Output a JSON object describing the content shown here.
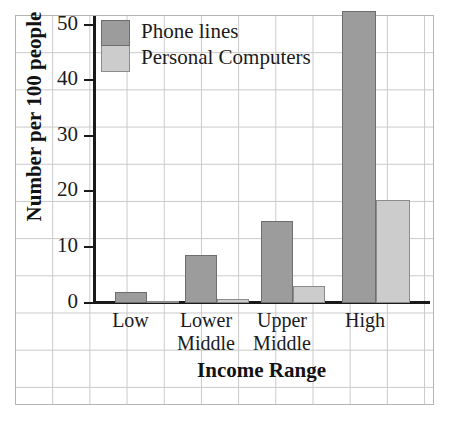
{
  "chart_data": {
    "type": "bar",
    "title": "",
    "xlabel": "Income Range",
    "ylabel": "Number per 100 people",
    "categories": [
      "Low",
      "Lower Middle",
      "Upper Middle",
      "High"
    ],
    "category_lines": [
      [
        "Low"
      ],
      [
        "Lower",
        "Middle"
      ],
      [
        "Upper",
        "Middle"
      ],
      [
        "High"
      ]
    ],
    "series": [
      {
        "name": "Phone lines",
        "color": "#9c9c9c",
        "values": [
          2,
          8.7,
          14.7,
          52.5
        ]
      },
      {
        "name": "Personal Computers",
        "color": "#cccccc",
        "values": [
          0.2,
          0.8,
          3,
          18.5
        ]
      }
    ],
    "ylim": [
      0,
      55
    ],
    "yticks": [
      0,
      10,
      20,
      30,
      40,
      50
    ],
    "ytick_labels": [
      "0",
      "10",
      "20",
      "30",
      "40",
      "50"
    ],
    "grid": true,
    "legend_position": "top-left"
  },
  "axes": {
    "y_title": "Number per 100 people",
    "x_title": "Income Range"
  },
  "legend": {
    "items": [
      {
        "label": "Phone lines"
      },
      {
        "label": "Personal Computers"
      }
    ]
  },
  "colors": {
    "phone_lines": "#9c9c9c",
    "personal_computers": "#cccccc",
    "axis": "#1a1a1a",
    "grid": "#c9c9c9"
  }
}
